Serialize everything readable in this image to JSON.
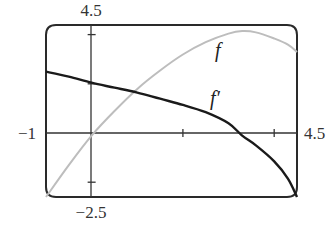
{
  "chart_data": {
    "type": "line",
    "title": "",
    "xlabel": "",
    "ylabel": "",
    "xlim": [
      -1,
      4.5
    ],
    "ylim": [
      -2.5,
      4.5
    ],
    "grid": false,
    "tick_labels": {
      "x_min": "−1",
      "x_max": "4.5",
      "y_max": "4.5",
      "y_min": "−2.5"
    },
    "x_ticks": [
      2,
      4
    ],
    "y_ticks": [
      -2,
      2,
      4
    ],
    "series": [
      {
        "name": "f",
        "color": "#b8b8b8",
        "x": [
          -1,
          -0.5,
          0,
          0.5,
          1,
          1.5,
          2,
          2.5,
          3,
          3.3,
          3.6,
          4,
          4.3,
          4.5
        ],
        "y": [
          -2.5,
          -1.2,
          0,
          1.0,
          1.9,
          2.65,
          3.3,
          3.8,
          4.15,
          4.25,
          4.2,
          3.95,
          3.7,
          3.4
        ]
      },
      {
        "name": "f′",
        "color": "#1a1a1a",
        "x": [
          -1,
          -0.5,
          0,
          0.5,
          1,
          1.5,
          2,
          2.5,
          3,
          3.3,
          3.6,
          4,
          4.3,
          4.5
        ],
        "y": [
          2.6,
          2.4,
          2.15,
          1.95,
          1.75,
          1.5,
          1.25,
          0.95,
          0.5,
          0.0,
          -0.4,
          -1.05,
          -1.75,
          -2.5
        ]
      }
    ],
    "annotations": [
      {
        "text": "f",
        "x": 2.85,
        "y": 3.5
      },
      {
        "text": "f′",
        "x": 2.75,
        "y": 1.2
      }
    ]
  },
  "labels": {
    "x_min": "−1",
    "x_max": "4.5",
    "y_max": "4.5",
    "y_min": "−2.5",
    "f": "f",
    "fprime": "f′"
  }
}
